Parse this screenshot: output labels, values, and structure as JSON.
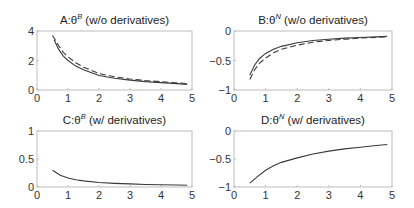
{
  "chart_data": [
    {
      "id": "A",
      "type": "line",
      "title": "A:θ",
      "title_sup": "B",
      "title_suffix": " (w/o derivatives)",
      "xlabel": "",
      "ylabel": "",
      "xlim": [
        0,
        5
      ],
      "ylim": [
        0,
        4
      ],
      "xticks": [
        0,
        1,
        2,
        3,
        4,
        5
      ],
      "yticks": [
        0,
        2,
        4
      ],
      "grid": false,
      "series": [
        {
          "name": "solid",
          "style": "solid",
          "x": [
            0.55,
            0.7,
            0.85,
            1.0,
            1.25,
            1.5,
            2.0,
            2.5,
            3.0,
            3.5,
            4.0,
            4.5,
            4.85
          ],
          "y": [
            3.4,
            2.75,
            2.3,
            2.0,
            1.62,
            1.37,
            0.98,
            0.8,
            0.67,
            0.57,
            0.5,
            0.43,
            0.38
          ]
        },
        {
          "name": "dashed",
          "style": "dashed",
          "x": [
            0.5,
            0.7,
            0.85,
            1.0,
            1.25,
            1.5,
            2.0,
            2.5,
            3.0,
            3.5,
            4.0,
            4.5,
            4.85
          ],
          "y": [
            3.7,
            3.0,
            2.55,
            2.25,
            1.85,
            1.55,
            1.12,
            0.9,
            0.75,
            0.64,
            0.56,
            0.49,
            0.44
          ]
        }
      ]
    },
    {
      "id": "B",
      "type": "line",
      "title": "B:θ",
      "title_sup": "N",
      "title_suffix": " (w/o derivatives)",
      "xlabel": "",
      "ylabel": "",
      "xlim": [
        0,
        5
      ],
      "ylim": [
        -1,
        0
      ],
      "xticks": [
        0,
        1,
        2,
        3,
        4,
        5
      ],
      "yticks": [
        -1,
        -0.5,
        0
      ],
      "grid": false,
      "series": [
        {
          "name": "solid",
          "style": "solid",
          "x": [
            0.5,
            0.65,
            0.8,
            1.0,
            1.25,
            1.5,
            2.0,
            2.5,
            3.0,
            3.5,
            4.0,
            4.5,
            4.85
          ],
          "y": [
            -0.75,
            -0.58,
            -0.47,
            -0.38,
            -0.31,
            -0.26,
            -0.2,
            -0.16,
            -0.14,
            -0.12,
            -0.11,
            -0.1,
            -0.09
          ]
        },
        {
          "name": "dashed",
          "style": "dashed",
          "x": [
            0.5,
            0.65,
            0.8,
            1.0,
            1.25,
            1.5,
            2.0,
            2.5,
            3.0,
            3.5,
            4.0,
            4.5,
            4.85
          ],
          "y": [
            -0.82,
            -0.66,
            -0.55,
            -0.46,
            -0.37,
            -0.31,
            -0.24,
            -0.19,
            -0.16,
            -0.14,
            -0.12,
            -0.11,
            -0.1
          ]
        }
      ]
    },
    {
      "id": "C",
      "type": "line",
      "title": "C:θ",
      "title_sup": "B",
      "title_suffix": " (w/ derivatives)",
      "xlabel": "",
      "ylabel": "",
      "xlim": [
        0,
        5
      ],
      "ylim": [
        0,
        1
      ],
      "xticks": [
        0,
        1,
        2,
        3,
        4,
        5
      ],
      "yticks": [
        0,
        0.5,
        1
      ],
      "grid": false,
      "series": [
        {
          "name": "solid",
          "style": "solid",
          "x": [
            0.5,
            0.75,
            1.0,
            1.25,
            1.5,
            2.0,
            2.5,
            3.0,
            3.5,
            4.0,
            4.5,
            4.85
          ],
          "y": [
            0.3,
            0.21,
            0.16,
            0.13,
            0.11,
            0.08,
            0.065,
            0.055,
            0.045,
            0.04,
            0.035,
            0.03
          ]
        }
      ]
    },
    {
      "id": "D",
      "type": "line",
      "title": "D:θ",
      "title_sup": "N",
      "title_suffix": " (w/ derivatives)",
      "xlabel": "",
      "ylabel": "",
      "xlim": [
        0,
        5
      ],
      "ylim": [
        -1,
        0
      ],
      "xticks": [
        0,
        1,
        2,
        3,
        4,
        5
      ],
      "yticks": [
        -1,
        -0.5,
        0
      ],
      "grid": false,
      "series": [
        {
          "name": "solid",
          "style": "solid",
          "x": [
            0.5,
            0.75,
            1.0,
            1.25,
            1.5,
            2.0,
            2.5,
            3.0,
            3.5,
            4.0,
            4.5,
            4.85
          ],
          "y": [
            -0.93,
            -0.81,
            -0.7,
            -0.62,
            -0.56,
            -0.48,
            -0.41,
            -0.36,
            -0.32,
            -0.29,
            -0.26,
            -0.24
          ]
        }
      ]
    }
  ]
}
